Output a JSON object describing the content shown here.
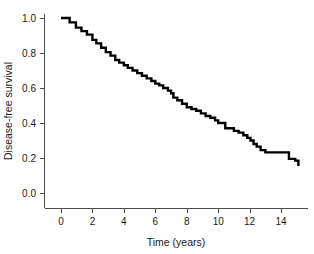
{
  "chart_data": {
    "type": "line",
    "title": "",
    "subtitle": "",
    "xlabel": "Time (years)",
    "ylabel": "Disease-free survival",
    "xlim": [
      0,
      15.6
    ],
    "ylim": [
      0.0,
      1.0
    ],
    "xticks": [
      0,
      2,
      4,
      6,
      8,
      10,
      12,
      14
    ],
    "xticklabels": [
      "0",
      "2",
      "4",
      "6",
      "8",
      "10",
      "12",
      "14"
    ],
    "yticks": [
      0.0,
      0.2,
      0.4,
      0.6,
      0.8,
      1.0
    ],
    "yticklabels": [
      "0.0",
      "0.2",
      "0.4",
      "0.6",
      "0.8",
      "1.0"
    ],
    "grid": false,
    "legend": null,
    "annotations": [],
    "line_color": "#000000",
    "axis_color": "#4d4d4d",
    "background_color": "#ffffff",
    "series": [
      {
        "name": "Disease-free survival",
        "style": "step-post",
        "x": [
          0.0,
          0.55,
          0.95,
          1.3,
          1.65,
          2.0,
          2.25,
          2.55,
          2.85,
          3.15,
          3.45,
          3.7,
          4.0,
          4.25,
          4.55,
          4.85,
          5.15,
          5.45,
          5.75,
          6.0,
          6.25,
          6.5,
          6.8,
          7.0,
          7.15,
          7.4,
          7.7,
          8.0,
          8.3,
          8.6,
          8.9,
          9.2,
          9.5,
          9.8,
          10.0,
          10.45,
          10.7,
          11.0,
          11.3,
          11.6,
          11.85,
          12.05,
          12.25,
          12.45,
          12.7,
          13.0,
          14.25,
          14.5,
          14.9,
          15.1
        ],
        "y": [
          1.0,
          0.975,
          0.945,
          0.925,
          0.905,
          0.875,
          0.855,
          0.83,
          0.805,
          0.785,
          0.76,
          0.745,
          0.73,
          0.715,
          0.7,
          0.685,
          0.67,
          0.655,
          0.64,
          0.625,
          0.615,
          0.6,
          0.585,
          0.57,
          0.545,
          0.53,
          0.51,
          0.49,
          0.48,
          0.47,
          0.455,
          0.44,
          0.43,
          0.415,
          0.4,
          0.37,
          0.37,
          0.355,
          0.345,
          0.33,
          0.315,
          0.3,
          0.28,
          0.265,
          0.245,
          0.232,
          0.232,
          0.195,
          0.185,
          0.155
        ]
      }
    ]
  },
  "axes": {
    "x_axis_name": "Time (years)",
    "y_axis_name": "Disease-free survival"
  }
}
